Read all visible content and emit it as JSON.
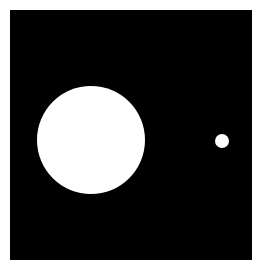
{
  "scene": {
    "description": "White circles on a black square field",
    "background_color": "#ffffff",
    "square": {
      "color": "#000000",
      "x": 10,
      "y": 10,
      "width": 242,
      "height": 250
    },
    "circles": [
      {
        "name": "large-circle",
        "color": "#ffffff",
        "cx": 91,
        "cy": 140,
        "r": 54
      },
      {
        "name": "small-circle",
        "color": "#ffffff",
        "cx": 222,
        "cy": 141,
        "r": 7
      }
    ]
  }
}
